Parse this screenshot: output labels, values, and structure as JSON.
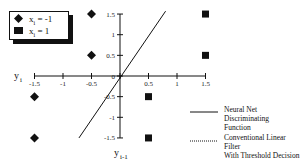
{
  "chart_data": {
    "type": "scatter",
    "title": "",
    "xlabel": "y_{i-1}",
    "ylabel": "y_i",
    "xlim": [
      -1.5,
      1.5
    ],
    "ylim": [
      -1.5,
      1.5
    ],
    "x_ticks": [
      "-1.5",
      "-1",
      "-0.5",
      "0",
      "0.5",
      "1",
      "1.5"
    ],
    "y_ticks": [
      "1.5",
      "1",
      "0.5",
      "0",
      "-0.5",
      "-1",
      "-1.5"
    ],
    "grid": false,
    "legend_position": "top-left",
    "series": [
      {
        "name": "x_i = -1",
        "marker": "diamond",
        "points": [
          [
            -0.5,
            1.5
          ],
          [
            -0.5,
            0.5
          ],
          [
            -1.5,
            -0.5
          ],
          [
            -1.5,
            -1.5
          ]
        ]
      },
      {
        "name": "x_i = 1",
        "marker": "square",
        "points": [
          [
            1.5,
            1.5
          ],
          [
            1.5,
            0.5
          ],
          [
            0.5,
            -0.5
          ],
          [
            0.5,
            -1.5
          ]
        ]
      }
    ],
    "lines": [
      {
        "name": "Neural Net Discriminating Function",
        "style": "solid",
        "points": [
          [
            -0.72,
            -1.5
          ],
          [
            0.8,
            1.57
          ]
        ]
      },
      {
        "name": "Conventional Linear Filter With Threshold Decision",
        "style": "dotted",
        "points": []
      }
    ]
  },
  "legend": {
    "markers": [
      {
        "var": "x",
        "sub": "i",
        "rest": " = -1"
      },
      {
        "var": "x",
        "sub": "i",
        "rest": " = 1"
      }
    ],
    "lines": [
      {
        "line1": "Neural Net Discriminating",
        "line2": "Function"
      },
      {
        "line1": "Conventional Linear Filter",
        "line2": "With Threshold Decision"
      }
    ]
  },
  "axes": {
    "y_label_var": "y",
    "y_label_sub": "i",
    "x_label_var": "y",
    "x_label_sub": "i-1"
  },
  "colors": {
    "ink": "#111111",
    "background": "#ffffff"
  }
}
